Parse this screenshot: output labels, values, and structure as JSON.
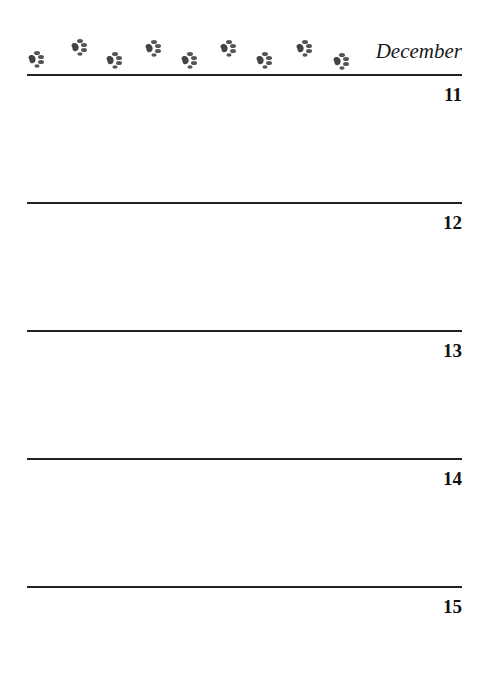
{
  "header": {
    "month": "December",
    "decoration": "paw-print-row",
    "paw_count": 9
  },
  "days": [
    {
      "number": "11",
      "notes": ""
    },
    {
      "number": "12",
      "notes": ""
    },
    {
      "number": "13",
      "notes": ""
    },
    {
      "number": "14",
      "notes": ""
    },
    {
      "number": "15",
      "notes": ""
    }
  ]
}
